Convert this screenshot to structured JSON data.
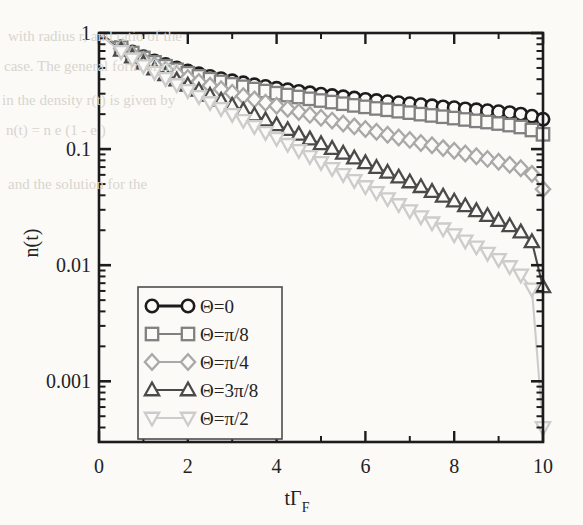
{
  "figure": {
    "background_color": "#fbfaf7",
    "frame_color": "#1c1c1c"
  },
  "chart_data": {
    "type": "line",
    "title": "",
    "xlabel": "tΓF",
    "xlabel_parts": {
      "base": "tΓ",
      "sub": "F"
    },
    "ylabel": "n(t)",
    "xlim": [
      0,
      10
    ],
    "ylim": [
      0.0003,
      1
    ],
    "yscale": "log",
    "xscale": "linear",
    "grid": false,
    "xticks": [
      0,
      2,
      4,
      6,
      8,
      10
    ],
    "xticklabels": [
      "0",
      "2",
      "4",
      "6",
      "8",
      "10"
    ],
    "xminorticks": [
      1,
      3,
      5,
      7,
      9
    ],
    "yticks": [
      1,
      0.1,
      0.01,
      0.001
    ],
    "yticklabels": [
      "1",
      "0.1",
      "0.01",
      "0.001"
    ],
    "legend_position": "lower-left-inset",
    "x": [
      0,
      0.25,
      0.5,
      0.75,
      1,
      1.25,
      1.5,
      1.75,
      2,
      2.25,
      2.5,
      2.75,
      3,
      3.25,
      3.5,
      3.75,
      4,
      4.25,
      4.5,
      4.75,
      5,
      5.25,
      5.5,
      5.75,
      6,
      6.25,
      6.5,
      6.75,
      7,
      7.25,
      7.5,
      7.75,
      8,
      8.25,
      8.5,
      8.75,
      9,
      9.25,
      9.5,
      9.75,
      10
    ],
    "series": [
      {
        "name": "Θ=0",
        "marker": "circle",
        "color": "#1c1c1c",
        "values": [
          1,
          0.86,
          0.76,
          0.685,
          0.625,
          0.575,
          0.535,
          0.5,
          0.47,
          0.445,
          0.423,
          0.404,
          0.387,
          0.372,
          0.358,
          0.346,
          0.334,
          0.324,
          0.314,
          0.305,
          0.297,
          0.289,
          0.282,
          0.275,
          0.268,
          0.262,
          0.256,
          0.251,
          0.246,
          0.241,
          0.236,
          0.231,
          0.227,
          0.222,
          0.218,
          0.214,
          0.21,
          0.206,
          0.2,
          0.192,
          0.181
        ]
      },
      {
        "name": "Θ=π/8",
        "marker": "square",
        "color": "#808080",
        "values": [
          1,
          0.855,
          0.75,
          0.672,
          0.61,
          0.559,
          0.517,
          0.481,
          0.45,
          0.423,
          0.4,
          0.379,
          0.361,
          0.344,
          0.329,
          0.316,
          0.303,
          0.292,
          0.281,
          0.271,
          0.262,
          0.254,
          0.246,
          0.238,
          0.231,
          0.224,
          0.218,
          0.212,
          0.206,
          0.2,
          0.195,
          0.19,
          0.185,
          0.18,
          0.175,
          0.171,
          0.166,
          0.161,
          0.155,
          0.146,
          0.134
        ]
      },
      {
        "name": "Θ=π/4",
        "marker": "diamond",
        "color": "#a8a8a8",
        "values": [
          1,
          0.845,
          0.735,
          0.652,
          0.585,
          0.53,
          0.484,
          0.444,
          0.41,
          0.379,
          0.352,
          0.328,
          0.306,
          0.286,
          0.268,
          0.251,
          0.236,
          0.222,
          0.209,
          0.197,
          0.186,
          0.176,
          0.166,
          0.157,
          0.149,
          0.141,
          0.133,
          0.126,
          0.12,
          0.113,
          0.108,
          0.102,
          0.0968,
          0.0917,
          0.0869,
          0.0823,
          0.0778,
          0.0733,
          0.0683,
          0.0612,
          0.0452
        ]
      },
      {
        "name": "Θ=3π/8",
        "marker": "triangle-up",
        "color": "#4a4a4a",
        "values": [
          1,
          0.83,
          0.71,
          0.62,
          0.548,
          0.488,
          0.437,
          0.393,
          0.355,
          0.32,
          0.29,
          0.263,
          0.238,
          0.216,
          0.196,
          0.178,
          0.162,
          0.147,
          0.134,
          0.122,
          0.111,
          0.101,
          0.0918,
          0.0836,
          0.0761,
          0.0692,
          0.063,
          0.0573,
          0.0521,
          0.0474,
          0.0431,
          0.0392,
          0.0356,
          0.0324,
          0.0294,
          0.0267,
          0.0242,
          0.0218,
          0.0193,
          0.0159,
          0.0065
        ]
      },
      {
        "name": "Θ=π/2",
        "marker": "triangle-down",
        "color": "#cccccc",
        "values": [
          1,
          0.82,
          0.695,
          0.6,
          0.523,
          0.46,
          0.406,
          0.36,
          0.32,
          0.284,
          0.252,
          0.224,
          0.199,
          0.177,
          0.157,
          0.139,
          0.124,
          0.11,
          0.0975,
          0.0866,
          0.0768,
          0.0682,
          0.0605,
          0.0537,
          0.0476,
          0.0423,
          0.0375,
          0.0333,
          0.0295,
          0.0262,
          0.0232,
          0.0206,
          0.0183,
          0.0162,
          0.0144,
          0.0127,
          0.0112,
          0.00974,
          0.00824,
          0.00624,
          0.0004
        ]
      }
    ],
    "legend_entries": [
      {
        "label": "Θ=0",
        "marker": "circle",
        "color": "#1c1c1c"
      },
      {
        "label": "Θ=π/8",
        "marker": "square",
        "color": "#808080"
      },
      {
        "label": "Θ=π/4",
        "marker": "diamond",
        "color": "#a8a8a8"
      },
      {
        "label": "Θ=3π/8",
        "marker": "triangle-up",
        "color": "#4a4a4a"
      },
      {
        "label": "Θ=π/2",
        "marker": "triangle-down",
        "color": "#cccccc"
      }
    ]
  }
}
